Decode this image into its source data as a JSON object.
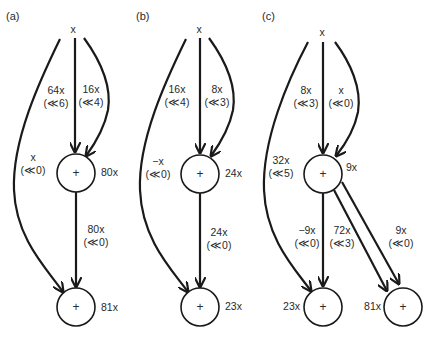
{
  "panels": [
    {
      "label": "(a)",
      "source": "x",
      "nodes": [
        {
          "id": "a1",
          "symbol": "+",
          "value": "80x"
        },
        {
          "id": "a2",
          "symbol": "+",
          "value": "81x"
        }
      ],
      "edges": [
        {
          "from": "x",
          "to": "a1",
          "weight": "64x",
          "shift": "(≪6)"
        },
        {
          "from": "x",
          "to": "a1",
          "weight": "16x",
          "shift": "(≪4)"
        },
        {
          "from": "x",
          "to": "a2",
          "weight": "x",
          "shift": "(≪0)"
        },
        {
          "from": "a1",
          "to": "a2",
          "weight": "80x",
          "shift": "(≪0)"
        }
      ]
    },
    {
      "label": "(b)",
      "source": "x",
      "nodes": [
        {
          "id": "b1",
          "symbol": "+",
          "value": "24x"
        },
        {
          "id": "b2",
          "symbol": "+",
          "value": "23x"
        }
      ],
      "edges": [
        {
          "from": "x",
          "to": "b1",
          "weight": "16x",
          "shift": "(≪4)"
        },
        {
          "from": "x",
          "to": "b1",
          "weight": "8x",
          "shift": "(≪3)"
        },
        {
          "from": "x",
          "to": "b2",
          "weight": "−x",
          "shift": "(≪0)"
        },
        {
          "from": "b1",
          "to": "b2",
          "weight": "24x",
          "shift": "(≪0)"
        }
      ]
    },
    {
      "label": "(c)",
      "source": "x",
      "nodes": [
        {
          "id": "c1",
          "symbol": "+",
          "value": "9x"
        },
        {
          "id": "c2",
          "symbol": "+",
          "value": "23x"
        },
        {
          "id": "c3",
          "symbol": "+",
          "value": "81x"
        }
      ],
      "edges": [
        {
          "from": "x",
          "to": "c1",
          "weight": "8x",
          "shift": "(≪3)"
        },
        {
          "from": "x",
          "to": "c1",
          "weight": "x",
          "shift": "(≪0)"
        },
        {
          "from": "x",
          "to": "c2",
          "weight": "32x",
          "shift": "(≪5)"
        },
        {
          "from": "c1",
          "to": "c2",
          "weight": "−9x",
          "shift": "(≪0)"
        },
        {
          "from": "c1",
          "to": "c3",
          "weight": "72x",
          "shift": "(≪3)"
        },
        {
          "from": "c1",
          "to": "c3",
          "weight": "9x",
          "shift": "(≪0)"
        }
      ]
    }
  ]
}
